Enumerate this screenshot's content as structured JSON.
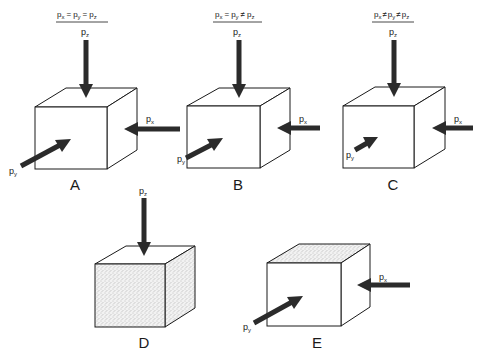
{
  "figure": {
    "panels": [
      {
        "id": "A",
        "label": "A",
        "condition": {
          "lhs": "p",
          "lhs_sub": "x",
          "op1": "=",
          "mid": "p",
          "mid_sub": "y",
          "op2": "=",
          "rhs": "p",
          "rhs_sub": "z"
        },
        "forces": {
          "pz": {
            "p": "p",
            "sub": "z"
          },
          "px": {
            "p": "p",
            "sub": "x"
          },
          "py": {
            "p": "p",
            "sub": "y"
          }
        },
        "shading": "none"
      },
      {
        "id": "B",
        "label": "B",
        "condition": {
          "lhs": "p",
          "lhs_sub": "x",
          "op1": "=",
          "mid": "p",
          "mid_sub": "y",
          "op2": "≠",
          "rhs": "p",
          "rhs_sub": "z"
        },
        "forces": {
          "pz": {
            "p": "p",
            "sub": "z"
          },
          "px": {
            "p": "p",
            "sub": "x"
          },
          "py": {
            "p": "p",
            "sub": "y"
          }
        },
        "shading": "none"
      },
      {
        "id": "C",
        "label": "C",
        "condition": {
          "lhs": "p",
          "lhs_sub": "x",
          "op1": "≠",
          "mid": "p",
          "mid_sub": "y",
          "op2": "≠",
          "rhs": "p",
          "rhs_sub": "z"
        },
        "forces": {
          "pz": {
            "p": "p",
            "sub": "z"
          },
          "px": {
            "p": "p",
            "sub": "x"
          },
          "py": {
            "p": "p",
            "sub": "y"
          }
        },
        "shading": "none"
      },
      {
        "id": "D",
        "label": "D",
        "forces": {
          "pz": {
            "p": "p",
            "sub": "z"
          }
        },
        "shading": "front-and-side-stippled"
      },
      {
        "id": "E",
        "label": "E",
        "forces": {
          "px": {
            "p": "p",
            "sub": "x"
          },
          "py": {
            "p": "p",
            "sub": "y"
          }
        },
        "shading": "top-stippled"
      }
    ],
    "colors": {
      "ink": "#1a1a1a",
      "arrow": "#2b2b2b",
      "background": "#ffffff",
      "stipple": "#8a8a8a"
    }
  }
}
